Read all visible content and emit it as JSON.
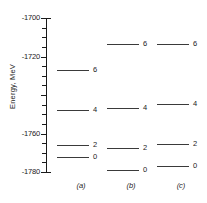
{
  "chart_data": {
    "type": "table",
    "title": "",
    "subtitle": "",
    "xlabel": "",
    "ylabel": "Energy, MeV",
    "ylim": [
      -1780,
      -1700
    ],
    "y_major_ticks": [
      -1700,
      -1720,
      -1740,
      -1760,
      -1780
    ],
    "y_major_tick_labels": [
      "-1700",
      "-1720",
      "-1740",
      "-1760",
      "-1780"
    ],
    "y_labeled_ticks": [
      "-1700",
      "-1720",
      "-1760",
      "-1780"
    ],
    "y_minor_tick_interval": 5,
    "grid": false,
    "legend": "none",
    "axis_color": "#1a1a1a",
    "level_color": "#3a3a3a",
    "columns": [
      {
        "caption": "(a)",
        "levels": [
          {
            "label": "6",
            "energy": -1727.0
          },
          {
            "label": "4",
            "energy": -1747.8
          },
          {
            "label": "2",
            "energy": -1766.0
          },
          {
            "label": "0",
            "energy": -1772.2
          }
        ]
      },
      {
        "caption": "(b)",
        "levels": [
          {
            "label": "6",
            "energy": -1713.5
          },
          {
            "label": "4",
            "energy": -1746.8
          },
          {
            "label": "2",
            "energy": -1767.6
          },
          {
            "label": "0",
            "energy": -1779.0
          }
        ]
      },
      {
        "caption": "(c)",
        "levels": [
          {
            "label": "6",
            "energy": -1713.5
          },
          {
            "label": "4",
            "energy": -1744.7
          },
          {
            "label": "2",
            "energy": -1765.5
          },
          {
            "label": "0",
            "energy": -1776.9
          }
        ]
      }
    ]
  }
}
